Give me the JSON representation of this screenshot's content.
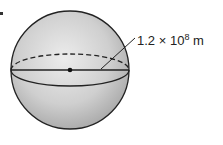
{
  "figure": {
    "shape": "sphere",
    "radius_label": {
      "coefficient": "1.2",
      "times": "×",
      "base": "10",
      "exponent": "8",
      "unit": "m"
    },
    "elements": [
      "sphere-outline",
      "equator-front-solid",
      "equator-back-dashed",
      "center-point",
      "radius-line",
      "leader-line"
    ],
    "colors": {
      "sphere_fill_light": "#e6e6e6",
      "sphere_fill_dark": "#a9a9a9",
      "stroke": "#222222"
    }
  }
}
